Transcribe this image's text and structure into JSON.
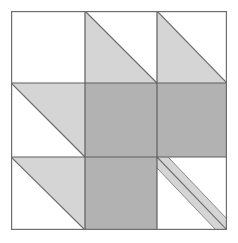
{
  "artwork": {
    "title": "Quilt Block Pattern",
    "kind": "three-by-three-patchwork-grid",
    "canvas": {
      "width": 238,
      "height": 243
    },
    "block": {
      "x": 11,
      "y": 11,
      "width": 216,
      "height": 219
    }
  },
  "palette": {
    "background": "#ffffff",
    "patch_white": "#ffffff",
    "patch_light_gray": "#d5d5d5",
    "patch_medium_gray": "#b2b2b2",
    "outline": "#6e6e6e",
    "grid_line": "#5e5e5e"
  },
  "grid": {
    "columns": 3,
    "rows": 3,
    "column_edges": [
      0,
      74,
      146,
      216
    ],
    "row_edges": [
      0,
      72,
      146,
      219
    ],
    "line_width": 1.2,
    "outline_width": 1.2
  },
  "cells": [
    {
      "id": "cell-r1c1",
      "row": 1,
      "column": 1,
      "name": "plain-white-square",
      "fill_type": "solid",
      "fill": "#ffffff"
    },
    {
      "id": "cell-r1c2",
      "row": 1,
      "column": 2,
      "name": "half-square-triangle-lower-left",
      "fill_type": "half-square-triangle",
      "triangle_corner": "lower-left",
      "triangle_fill": "#d5d5d5",
      "background_fill": "#ffffff"
    },
    {
      "id": "cell-r1c3",
      "row": 1,
      "column": 3,
      "name": "half-square-triangle-lower-left",
      "fill_type": "half-square-triangle",
      "triangle_corner": "lower-left",
      "triangle_fill": "#d5d5d5",
      "background_fill": "#ffffff"
    },
    {
      "id": "cell-r2c1",
      "row": 2,
      "column": 1,
      "name": "half-square-triangle-upper-right",
      "fill_type": "half-square-triangle",
      "triangle_corner": "upper-right",
      "triangle_fill": "#d5d5d5",
      "background_fill": "#ffffff"
    },
    {
      "id": "cell-r2c2",
      "row": 2,
      "column": 2,
      "name": "solid-gray-square",
      "fill_type": "solid",
      "fill": "#b2b2b2"
    },
    {
      "id": "cell-r2c3",
      "row": 2,
      "column": 3,
      "name": "solid-gray-square",
      "fill_type": "solid",
      "fill": "#b2b2b2"
    },
    {
      "id": "cell-r3c1",
      "row": 3,
      "column": 1,
      "name": "half-square-triangle-upper-right",
      "fill_type": "half-square-triangle",
      "triangle_corner": "upper-right",
      "triangle_fill": "#d5d5d5",
      "background_fill": "#ffffff"
    },
    {
      "id": "cell-r3c2",
      "row": 3,
      "column": 2,
      "name": "solid-gray-square",
      "fill_type": "solid",
      "fill": "#b2b2b2"
    },
    {
      "id": "cell-r3c3",
      "row": 3,
      "column": 3,
      "name": "diagonal-stripe-square",
      "fill_type": "diagonal-stripe",
      "stripe_fill": "#d5d5d5",
      "background_fill": "#ffffff",
      "stripe_direction": "top-left-to-bottom-right",
      "stripe_width": 11
    }
  ]
}
